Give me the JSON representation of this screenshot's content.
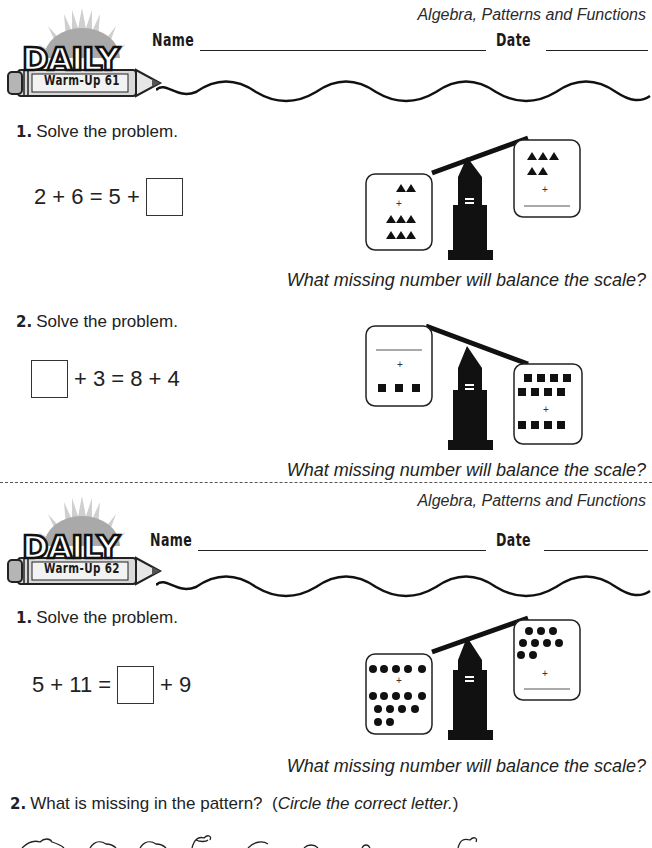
{
  "worksheets": [
    {
      "subject": "Algebra, Patterns and Functions",
      "logo": {
        "title": "DAILY",
        "subtitle": "Warm-Up 61"
      },
      "name_label": "Name",
      "date_label": "Date",
      "questions": [
        {
          "number": "1.",
          "instruction": "Solve the problem.",
          "equation": {
            "left": "2 + 6 = 5 +",
            "right": "",
            "box_position": "end"
          },
          "scale": {
            "shape": "triangle",
            "tilt": "left-down",
            "left_pan": {
              "top_count": 2,
              "bottom_count": 6,
              "plus": "+",
              "blank": false
            },
            "right_pan": {
              "top_count": 5,
              "plus": "+",
              "blank": true
            },
            "center_symbol": "="
          },
          "prompt": "What missing number will balance the scale?"
        },
        {
          "number": "2.",
          "instruction": "Solve the problem.",
          "equation": {
            "left": "",
            "right": "+ 3 = 8 + 4",
            "box_position": "start"
          },
          "scale": {
            "shape": "square",
            "tilt": "right-down",
            "left_pan": {
              "blank": true,
              "plus": "+",
              "bottom_count": 3
            },
            "right_pan": {
              "top_count": 8,
              "plus": "+",
              "bottom_count": 4,
              "blank": false
            },
            "center_symbol": "="
          },
          "prompt": "What missing number will balance the scale?"
        }
      ]
    },
    {
      "subject": "Algebra, Patterns and Functions",
      "logo": {
        "title": "DAILY",
        "subtitle": "Warm-Up 62"
      },
      "name_label": "Name",
      "date_label": "Date",
      "questions": [
        {
          "number": "1.",
          "instruction": "Solve the problem.",
          "equation": {
            "left": "5 + 11 =",
            "right": "+ 9",
            "box_position": "middle"
          },
          "scale": {
            "shape": "circle",
            "tilt": "left-down",
            "left_pan": {
              "top_count": 5,
              "plus": "+",
              "bottom_count": 11,
              "blank": false
            },
            "right_pan": {
              "top_count": 9,
              "plus": "+",
              "blank": true
            },
            "center_symbol": "="
          },
          "prompt": "What missing number will balance the scale?"
        },
        {
          "number": "2.",
          "instruction_main": "What is missing in the pattern?",
          "instruction_paren_open": "(",
          "instruction_italic": "Circle the correct letter.",
          "instruction_paren_close": ")",
          "pattern_items": [
            "animal-1",
            "animal-2",
            "animal-3",
            "animal-4",
            "animal-5",
            "animal-6",
            "animal-7",
            "animal-8"
          ]
        }
      ]
    }
  ]
}
